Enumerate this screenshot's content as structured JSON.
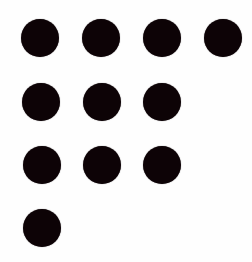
{
  "figure": {
    "dot_count": 11,
    "dot_color": "#0d0306",
    "background_color": "#fefefe",
    "dot_diameter": 38,
    "rows": [
      {
        "count": 4
      },
      {
        "count": 3
      },
      {
        "count": 3
      },
      {
        "count": 1
      }
    ],
    "dots": [
      {
        "cx": 40,
        "cy": 38
      },
      {
        "cx": 101,
        "cy": 38
      },
      {
        "cx": 162,
        "cy": 38
      },
      {
        "cx": 223,
        "cy": 38
      },
      {
        "cx": 41,
        "cy": 102
      },
      {
        "cx": 102,
        "cy": 102
      },
      {
        "cx": 162,
        "cy": 102
      },
      {
        "cx": 42,
        "cy": 165
      },
      {
        "cx": 102,
        "cy": 165
      },
      {
        "cx": 162,
        "cy": 165
      },
      {
        "cx": 42,
        "cy": 228
      }
    ]
  }
}
